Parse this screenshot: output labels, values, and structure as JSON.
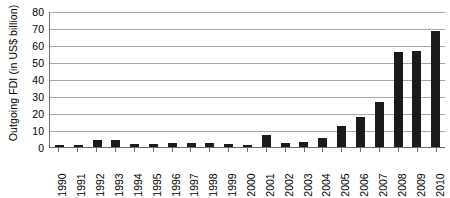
{
  "chart_data": {
    "type": "bar",
    "title": "",
    "xlabel": "",
    "ylabel": "Outgoing FDI (in US$ billion)",
    "ylim": [
      0,
      80
    ],
    "ytick_step": 10,
    "yticks": [
      0,
      10,
      20,
      30,
      40,
      50,
      60,
      70,
      80
    ],
    "grid": true,
    "legend": "none",
    "bar_color": "#1a1a1a",
    "categories": [
      "1990",
      "1991",
      "1992",
      "1993",
      "1994",
      "1995",
      "1996",
      "1997",
      "1998",
      "1999",
      "2000",
      "2001",
      "2002",
      "2003",
      "2004",
      "2005",
      "2006",
      "2007",
      "2008",
      "2009",
      "2010"
    ],
    "values": [
      1,
      1,
      4,
      4.4,
      2,
      2,
      2.1,
      2.6,
      2.6,
      1.8,
      0.9,
      6.9,
      2.5,
      2.9,
      5.5,
      12.3,
      17.6,
      26.5,
      55.9,
      56.5,
      68.0
    ]
  }
}
